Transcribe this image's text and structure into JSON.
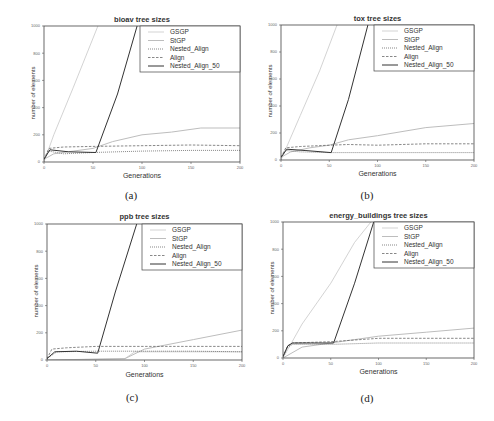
{
  "chart_data": [
    {
      "id": "a",
      "type": "line",
      "title": "bioav tree sizes",
      "subcaption": "(a)",
      "xlabel": "Generations",
      "ylabel": "number of elements",
      "xlim": [
        0,
        200
      ],
      "ylim": [
        0,
        1000
      ],
      "xticks": [
        0,
        50,
        100,
        150,
        200
      ],
      "yticks": [
        0,
        200,
        400,
        600,
        800,
        1000
      ],
      "legend": [
        "GSGP",
        "StGP",
        "Nested_Align",
        "Align",
        "Nested_Align_50"
      ],
      "legend_position": "top-right",
      "series": [
        {
          "name": "GSGP",
          "x": [
            0,
            10,
            30,
            55
          ],
          "y": [
            0,
            200,
            550,
            1000
          ]
        },
        {
          "name": "StGP",
          "x": [
            0,
            10,
            30,
            50,
            70,
            100,
            130,
            160,
            200
          ],
          "y": [
            20,
            60,
            80,
            100,
            150,
            200,
            220,
            250,
            250
          ]
        },
        {
          "name": "Nested_Align",
          "x": [
            0,
            5,
            20,
            50,
            100,
            150,
            200
          ],
          "y": [
            20,
            80,
            60,
            70,
            80,
            85,
            85
          ]
        },
        {
          "name": "Align",
          "x": [
            0,
            5,
            20,
            50,
            100,
            150,
            200
          ],
          "y": [
            20,
            100,
            110,
            115,
            120,
            125,
            120
          ]
        },
        {
          "name": "Nested_Align_50",
          "x": [
            0,
            6,
            25,
            53,
            75,
            95
          ],
          "y": [
            20,
            90,
            75,
            70,
            500,
            1000
          ]
        }
      ]
    },
    {
      "id": "b",
      "type": "line",
      "title": "tox tree sizes",
      "subcaption": "(b)",
      "xlabel": "Generations",
      "ylabel": "number of elements",
      "xlim": [
        0,
        200
      ],
      "ylim": [
        0,
        1000
      ],
      "xticks": [
        0,
        50,
        100,
        150,
        200
      ],
      "yticks": [
        0,
        200,
        400,
        600,
        800,
        1000
      ],
      "legend": [
        "GSGP",
        "StGP",
        "Nested_Align",
        "Align",
        "Nested_Align_50"
      ],
      "legend_position": "top-right",
      "series": [
        {
          "name": "GSGP",
          "x": [
            0,
            20,
            40,
            58
          ],
          "y": [
            0,
            330,
            660,
            1000
          ]
        },
        {
          "name": "StGP",
          "x": [
            0,
            10,
            30,
            50,
            70,
            100,
            150,
            200
          ],
          "y": [
            20,
            60,
            90,
            110,
            150,
            180,
            240,
            270
          ]
        },
        {
          "name": "Nested_Align",
          "x": [
            0,
            5,
            20,
            50,
            100,
            150,
            200
          ],
          "y": [
            20,
            70,
            60,
            55,
            55,
            55,
            55
          ]
        },
        {
          "name": "Align",
          "x": [
            0,
            5,
            20,
            50,
            70,
            100,
            150,
            200
          ],
          "y": [
            20,
            90,
            100,
            110,
            115,
            110,
            120,
            120
          ]
        },
        {
          "name": "Nested_Align_50",
          "x": [
            0,
            6,
            25,
            52,
            70,
            90
          ],
          "y": [
            20,
            80,
            70,
            55,
            450,
            1000
          ]
        }
      ]
    },
    {
      "id": "c",
      "type": "line",
      "title": "ppb tree sizes",
      "subcaption": "(c)",
      "xlabel": "Generations",
      "ylabel": "number of elements",
      "xlim": [
        0,
        200
      ],
      "ylim": [
        0,
        1000
      ],
      "xticks": [
        0,
        50,
        100,
        150,
        200
      ],
      "yticks": [
        0,
        200,
        400,
        600,
        800,
        1000
      ],
      "legend": [
        "GSGP",
        "StGP",
        "Nested_Align",
        "Align",
        "Nested_Align_50"
      ],
      "legend_position": "top-right",
      "series": [
        {
          "name": "GSGP",
          "x": [
            0,
            50,
            80,
            90,
            200
          ],
          "y": [
            0,
            5,
            10,
            60,
            60
          ]
        },
        {
          "name": "StGP",
          "x": [
            0,
            80,
            100,
            150,
            200
          ],
          "y": [
            0,
            10,
            80,
            150,
            220
          ]
        },
        {
          "name": "Nested_Align",
          "x": [
            0,
            10,
            50,
            100,
            150,
            200
          ],
          "y": [
            10,
            60,
            65,
            65,
            65,
            60
          ]
        },
        {
          "name": "Align",
          "x": [
            0,
            5,
            20,
            50,
            100,
            150,
            200
          ],
          "y": [
            10,
            80,
            90,
            100,
            100,
            100,
            100
          ]
        },
        {
          "name": "Nested_Align_50",
          "x": [
            0,
            8,
            30,
            52,
            70,
            92
          ],
          "y": [
            10,
            60,
            65,
            50,
            500,
            1000
          ]
        }
      ]
    },
    {
      "id": "d",
      "type": "line",
      "title": "energy_buildings tree sizes",
      "subcaption": "(d)",
      "xlabel": "Generations",
      "ylabel": "number of elements",
      "xlim": [
        0,
        200
      ],
      "ylim": [
        0,
        1000
      ],
      "xticks": [
        0,
        50,
        100,
        150,
        200
      ],
      "yticks": [
        0,
        200,
        400,
        600,
        800,
        1000
      ],
      "legend": [
        "GSGP",
        "StGP",
        "Nested_Align",
        "Align",
        "Nested_Align_50"
      ],
      "legend_position": "top-right",
      "series": [
        {
          "name": "GSGP",
          "x": [
            0,
            20,
            50,
            75,
            92
          ],
          "y": [
            0,
            250,
            550,
            850,
            1000
          ]
        },
        {
          "name": "StGP",
          "x": [
            0,
            20,
            50,
            100,
            150,
            200
          ],
          "y": [
            0,
            80,
            110,
            160,
            190,
            220
          ]
        },
        {
          "name": "Nested_Align",
          "x": [
            0,
            5,
            10,
            50,
            100,
            150,
            200
          ],
          "y": [
            10,
            80,
            100,
            100,
            110,
            110,
            110
          ]
        },
        {
          "name": "Align",
          "x": [
            0,
            5,
            10,
            50,
            90,
            100,
            150,
            200
          ],
          "y": [
            10,
            90,
            110,
            120,
            140,
            145,
            145,
            145
          ]
        },
        {
          "name": "Nested_Align_50",
          "x": [
            0,
            5,
            10,
            30,
            53,
            75,
            95
          ],
          "y": [
            10,
            90,
            110,
            110,
            110,
            550,
            1000
          ]
        }
      ]
    }
  ],
  "styles": {
    "GSGP": {
      "color": "#c8c8c8",
      "dash": "",
      "width": 0.8
    },
    "StGP": {
      "color": "#bdbdbd",
      "dash": "",
      "width": 1.0
    },
    "Nested_Align": {
      "color": "#555555",
      "dash": "1,1",
      "width": 0.7
    },
    "Align": {
      "color": "#555555",
      "dash": "2.5,1.5",
      "width": 0.7
    },
    "Nested_Align_50": {
      "color": "#333333",
      "dash": "",
      "width": 1.0
    }
  },
  "panels": [
    {
      "title": "bioav tree sizes",
      "sub": "(a)",
      "xlabel": "Generations",
      "ylabel": "number of elements"
    },
    {
      "title": "tox tree sizes",
      "sub": "(b)",
      "xlabel": "Generations",
      "ylabel": "number of elements"
    },
    {
      "title": "ppb tree sizes",
      "sub": "(c)",
      "xlabel": "Generations",
      "ylabel": "number of elements"
    },
    {
      "title": "energy_buildings tree sizes",
      "sub": "(d)",
      "xlabel": "Generations",
      "ylabel": "number of elements"
    }
  ]
}
